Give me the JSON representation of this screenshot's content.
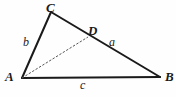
{
  "diagram": {
    "background_color": "#fefefe",
    "stroke_color": "#1a1a1a",
    "dashed_color": "#555555",
    "vertices": [
      {
        "name": "C",
        "label": "C",
        "x": 51,
        "y": 12
      },
      {
        "name": "A",
        "label": "A",
        "x": 22,
        "y": 78
      },
      {
        "name": "B",
        "label": "B",
        "x": 160,
        "y": 77
      },
      {
        "name": "D",
        "label": "D",
        "x": 88,
        "y": 37
      }
    ],
    "solid_edges": [
      {
        "name": "edge-CA",
        "from": "C",
        "to": "A",
        "x1": 51,
        "y1": 12,
        "x2": 22,
        "y2": 78
      },
      {
        "name": "edge-CB",
        "from": "C",
        "to": "B",
        "x1": 51,
        "y1": 12,
        "x2": 160,
        "y2": 77
      },
      {
        "name": "edge-AB",
        "from": "A",
        "to": "B",
        "x1": 22,
        "y1": 78,
        "x2": 160,
        "y2": 77
      }
    ],
    "dashed_edges": [
      {
        "name": "edge-AD",
        "from": "A",
        "to": "D",
        "x1": 22,
        "y1": 78,
        "x2": 88,
        "y2": 37
      }
    ],
    "side_labels": [
      {
        "name": "side-a",
        "label": "a",
        "x": 109,
        "y": 36
      },
      {
        "name": "side-b",
        "label": "b",
        "x": 23,
        "y": 36
      },
      {
        "name": "side-c",
        "label": "c",
        "x": 80,
        "y": 79
      }
    ]
  },
  "labels": {
    "vertex_C": "C",
    "vertex_A": "A",
    "vertex_B": "B",
    "point_D": "D",
    "side_a": "a",
    "side_b": "b",
    "side_c": "c"
  }
}
